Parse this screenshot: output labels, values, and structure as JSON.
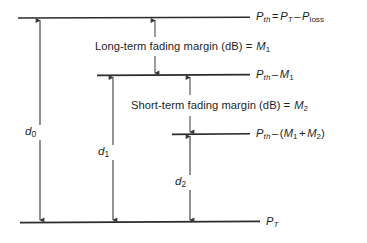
{
  "figure": {
    "type": "link-budget-fading-margin-diagram",
    "background_color": "#ffffff",
    "line_color": "#2b2b2b",
    "text_color": "#1e1e1e"
  },
  "levels": [
    {
      "id": "p-th",
      "label_plain": "Pth = PT - Ploss",
      "symbol": "P",
      "symbol_sub": "th",
      "equals": "=",
      "rhs_symbol": "P",
      "rhs_sub": "T",
      "minus": "–",
      "term2_symbol": "P",
      "term2_sub": "loss",
      "y": 18,
      "x_start": 18,
      "x_end": 250
    },
    {
      "id": "p-th-minus-m1",
      "label_plain": "Pth - M1",
      "symbol": "P",
      "symbol_sub": "th",
      "minus": "–",
      "term2_symbol": "M",
      "term2_sub": "1",
      "y": 75,
      "x_start": 97,
      "x_end": 250
    },
    {
      "id": "p-th-minus-m1-plus-m2",
      "label_plain": "Pth - (M1 + M2)",
      "symbol": "P",
      "symbol_sub": "th",
      "minus": "–",
      "open_paren": "(",
      "term2_symbol": "M",
      "term2_sub": "1",
      "plus": "+",
      "term3_symbol": "M",
      "term3_sub": "2",
      "close_paren": ")",
      "y": 134,
      "x_start": 172,
      "x_end": 250
    },
    {
      "id": "p-t",
      "label_plain": "PT",
      "symbol": "P",
      "symbol_sub": "T",
      "y": 222,
      "x_start": 20,
      "x_end": 260
    }
  ],
  "margins": [
    {
      "id": "long-term-fading-margin",
      "text": "Long-term fading margin (dB) =",
      "symbol": "M",
      "symbol_sub": "1",
      "full_text": "Long-term fading margin (dB) = M1",
      "arrow_x": 155,
      "arrow_top_y": 18,
      "arrow_bottom_y": 75
    },
    {
      "id": "short-term-fading-margin",
      "text": "Short-term fading margin (dB) =",
      "symbol": "M",
      "symbol_sub": "2",
      "full_text": "Short-term fading margin (dB) = M2",
      "arrow_x": 190,
      "arrow_top_y": 75,
      "arrow_bottom_y": 134
    }
  ],
  "distances": [
    {
      "id": "d0",
      "symbol": "d",
      "symbol_sub": "0",
      "label_plain": "d0",
      "arrow_x": 40,
      "top_y": 18,
      "bottom_y": 222
    },
    {
      "id": "d1",
      "symbol": "d",
      "symbol_sub": "1",
      "label_plain": "d1",
      "arrow_x": 113,
      "top_y": 75,
      "bottom_y": 222
    },
    {
      "id": "d2",
      "symbol": "d",
      "symbol_sub": "2",
      "label_plain": "d2",
      "arrow_x": 190,
      "top_y": 134,
      "bottom_y": 222
    }
  ]
}
